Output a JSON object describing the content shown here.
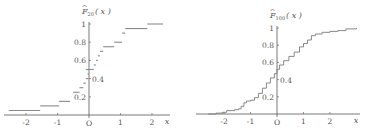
{
  "chart_data": [
    {
      "type": "line",
      "step": true,
      "title": "",
      "ylabel": "F̂_20(x)",
      "ylabel_main": "F",
      "ylabel_sub": "20",
      "ylabel_arg": "( x )",
      "xlabel": "x",
      "origin_label": "O",
      "xlim": [
        -2.6,
        2.6
      ],
      "ylim": [
        0,
        1
      ],
      "x_ticks": [
        -2,
        -1,
        1,
        2
      ],
      "x_tick_labels": [
        "-2",
        "-1",
        "1",
        "2"
      ],
      "y_ticks": [
        0.2,
        0.4,
        0.6,
        0.8,
        1
      ],
      "y_tick_labels": [
        "0.2",
        "0.4",
        "0.6",
        "0.8",
        "1"
      ],
      "grid": false,
      "steps": [
        {
          "x0": -2.55,
          "x1": -1.55,
          "y": 0.05
        },
        {
          "x0": -1.55,
          "x1": -0.95,
          "y": 0.1
        },
        {
          "x0": -0.95,
          "x1": -0.6,
          "y": 0.15
        },
        {
          "x0": -0.5,
          "x1": -0.3,
          "y": 0.25
        },
        {
          "x0": -0.3,
          "x1": -0.18,
          "y": 0.3
        },
        {
          "x0": -0.18,
          "x1": -0.1,
          "y": 0.35
        },
        {
          "x0": -0.1,
          "x1": -0.02,
          "y": 0.4
        },
        {
          "x0": -0.05,
          "x1": 0.0,
          "y": 0.45
        },
        {
          "x0": -0.1,
          "x1": 0.15,
          "y": 0.5
        },
        {
          "x0": 0.15,
          "x1": 0.22,
          "y": 0.55
        },
        {
          "x0": 0.22,
          "x1": 0.28,
          "y": 0.6
        },
        {
          "x0": 0.28,
          "x1": 0.35,
          "y": 0.65
        },
        {
          "x0": 0.35,
          "x1": 0.45,
          "y": 0.7
        },
        {
          "x0": 0.45,
          "x1": 0.8,
          "y": 0.75
        },
        {
          "x0": 0.8,
          "x1": 1.05,
          "y": 0.8
        },
        {
          "x0": 1.05,
          "x1": 1.15,
          "y": 0.9
        },
        {
          "x0": 1.15,
          "x1": 1.85,
          "y": 0.95
        },
        {
          "x0": 1.85,
          "x1": 2.35,
          "y": 1.0
        }
      ]
    },
    {
      "type": "line",
      "step": true,
      "title": "",
      "ylabel": "F̂_100(x)",
      "ylabel_main": "F",
      "ylabel_sub": "100",
      "ylabel_arg": "( x )",
      "xlabel": "x",
      "origin_label": "O",
      "xlim": [
        -2.7,
        3.0
      ],
      "ylim": [
        0,
        1
      ],
      "x_ticks": [
        -2,
        -1,
        1,
        2
      ],
      "x_tick_labels": [
        "-2",
        "-1",
        "1",
        "2"
      ],
      "y_ticks": [
        0.2,
        0.4,
        0.6,
        0.8,
        1
      ],
      "y_tick_labels": [
        "0.2",
        "0.4",
        "0.6",
        "0.8",
        "1"
      ],
      "grid": false,
      "curve": [
        [
          -2.6,
          0.0
        ],
        [
          -2.3,
          0.01
        ],
        [
          -2.05,
          0.02
        ],
        [
          -1.9,
          0.04
        ],
        [
          -1.6,
          0.05
        ],
        [
          -1.45,
          0.06
        ],
        [
          -1.35,
          0.09
        ],
        [
          -1.25,
          0.13
        ],
        [
          -1.15,
          0.15
        ],
        [
          -1.0,
          0.16
        ],
        [
          -0.85,
          0.19
        ],
        [
          -0.7,
          0.24
        ],
        [
          -0.55,
          0.3
        ],
        [
          -0.4,
          0.36
        ],
        [
          -0.25,
          0.42
        ],
        [
          -0.1,
          0.47
        ],
        [
          0.0,
          0.52
        ],
        [
          0.1,
          0.57
        ],
        [
          0.25,
          0.62
        ],
        [
          0.45,
          0.67
        ],
        [
          0.65,
          0.72
        ],
        [
          0.85,
          0.78
        ],
        [
          1.0,
          0.82
        ],
        [
          1.15,
          0.86
        ],
        [
          1.3,
          0.91
        ],
        [
          1.45,
          0.93
        ],
        [
          1.7,
          0.95
        ],
        [
          2.0,
          0.96
        ],
        [
          2.3,
          0.97
        ],
        [
          2.6,
          0.99
        ],
        [
          3.0,
          1.0
        ]
      ]
    }
  ]
}
